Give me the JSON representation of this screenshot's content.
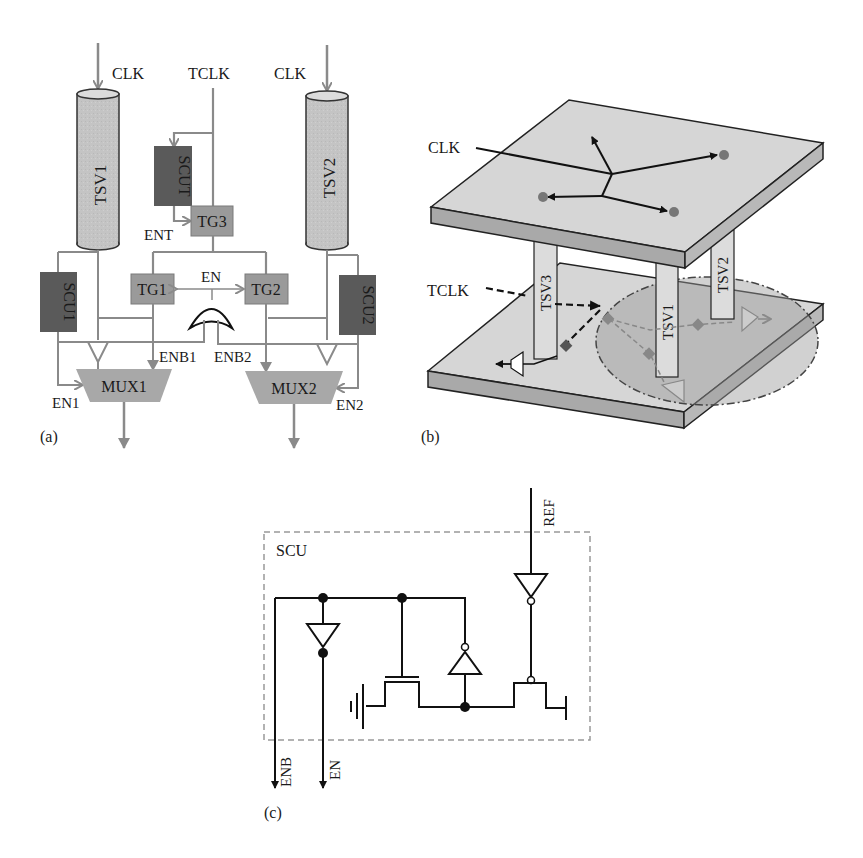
{
  "panel_a": {
    "caption": "(a)",
    "inputs": {
      "clk_left": "CLK",
      "tclk": "TCLK",
      "clk_right": "CLK"
    },
    "tsv_left": "TSV1",
    "tsv_right": "TSV2",
    "scut": "SCUT",
    "tg3": "TG3",
    "ent": "ENT",
    "scu1": "SCU1",
    "scu2": "SCU2",
    "tg1": "TG1",
    "tg2": "TG2",
    "en": "EN",
    "enb1": "ENB1",
    "enb2": "ENB2",
    "mux1": "MUX1",
    "mux2": "MUX2",
    "en1": "EN1",
    "en2": "EN2"
  },
  "panel_b": {
    "caption": "(b)",
    "clk": "CLK",
    "tclk": "TCLK",
    "tsv3": "TSV3",
    "tsv1": "TSV1",
    "tsv2": "TSV2"
  },
  "panel_c": {
    "caption": "(c)",
    "box_label": "SCU",
    "ref": "REF",
    "enb": "ENB",
    "en": "EN"
  },
  "colors": {
    "wire_gray": "#8a8a8a",
    "tsv_fill": "#c4c4c4",
    "dark_block": "#5a5a5a",
    "mid_block": "#9a9a9a",
    "mux_fill": "#a8a8a8",
    "plate_top": "#d6d6d6",
    "plate_side": "#a9a9a9",
    "highlight_ellipse": "#b0b0b0"
  }
}
